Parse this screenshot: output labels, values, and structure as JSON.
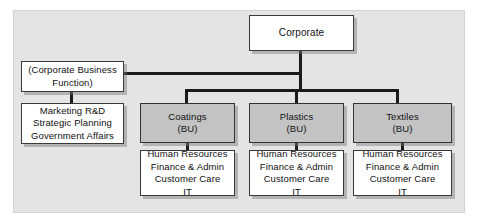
{
  "diagram": {
    "colors": {
      "canvas_background": "#e4e4e4",
      "page_background": "#ffffff",
      "box_fill": "#ffffff",
      "business_unit_fill": "#c3c3c3",
      "border": "#3a3a3a",
      "connector": "#1b1b1b",
      "text": "#111111"
    }
  },
  "nodes": {
    "corporate": {
      "label": "Corporate"
    },
    "corporate_business_function": {
      "label": "(Corporate Business\nFunction)"
    },
    "corporate_staff_functions": {
      "label": "Marketing R&D\nStrategic Planning\nGovernment Affairs"
    }
  },
  "business_units": [
    {
      "name": "Coatings",
      "label": "Coatings\n(BU)",
      "functions_label": "Human Resources\nFinance & Admin\nCustomer Care\nIT"
    },
    {
      "name": "Plastics",
      "label": "Plastics\n(BU)",
      "functions_label": "Human Resources\nFinance & Admin\nCustomer Care\nIT"
    },
    {
      "name": "Textiles",
      "label": "Textiles\n(BU)",
      "functions_label": "Human Resources\nFinance & Admin\nCustomer Care\nIT"
    }
  ]
}
